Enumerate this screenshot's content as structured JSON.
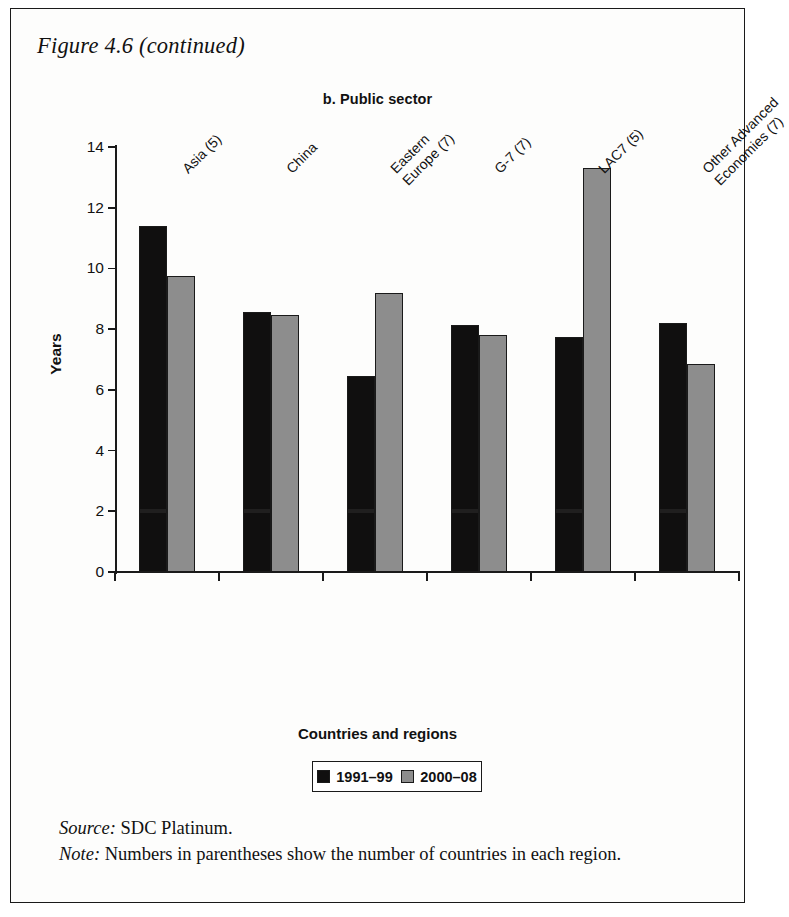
{
  "figure": {
    "title": "Figure 4.6 (continued)",
    "panel_title": "b. Public sector"
  },
  "notes": {
    "source_lead": "Source:",
    "source_text": " SDC Platinum.",
    "note_lead": "Note:",
    "note_text": " Numbers in parentheses show the number of countries in each region."
  },
  "legend": {
    "items": [
      {
        "label": "1991–99",
        "color": "#100f0f"
      },
      {
        "label": "2000–08",
        "color": "#8d8d8d"
      }
    ]
  },
  "chart_data": {
    "type": "bar",
    "title": "b. Public sector",
    "xlabel": "Countries and regions",
    "ylabel": "Years",
    "ylim": [
      0,
      14
    ],
    "yticks": [
      0,
      2,
      4,
      6,
      8,
      10,
      12,
      14
    ],
    "ytick_labels": [
      "0",
      "2",
      "4",
      "6",
      "8",
      "10",
      "12",
      "14"
    ],
    "grid": false,
    "legend_position": "bottom",
    "categories": [
      "Asia (5)",
      "China",
      "Eastern Europe (7)",
      "G-7 (7)",
      "LAC7 (5)",
      "Other Advanced Economies (7)"
    ],
    "category_label_lines": [
      [
        "Asia (5)"
      ],
      [
        "China"
      ],
      [
        "Eastern",
        "Europe (7)"
      ],
      [
        "G-7 (7)"
      ],
      [
        "LAC7 (5)"
      ],
      [
        "Other Advanced",
        "Economies (7)"
      ]
    ],
    "series": [
      {
        "name": "1991–99",
        "color": "#100f0f",
        "values": [
          11.4,
          8.55,
          6.45,
          8.15,
          7.75,
          8.2
        ]
      },
      {
        "name": "2000–08",
        "color": "#8d8d8d",
        "values": [
          9.75,
          8.45,
          9.2,
          7.8,
          13.3,
          6.85
        ]
      }
    ]
  }
}
